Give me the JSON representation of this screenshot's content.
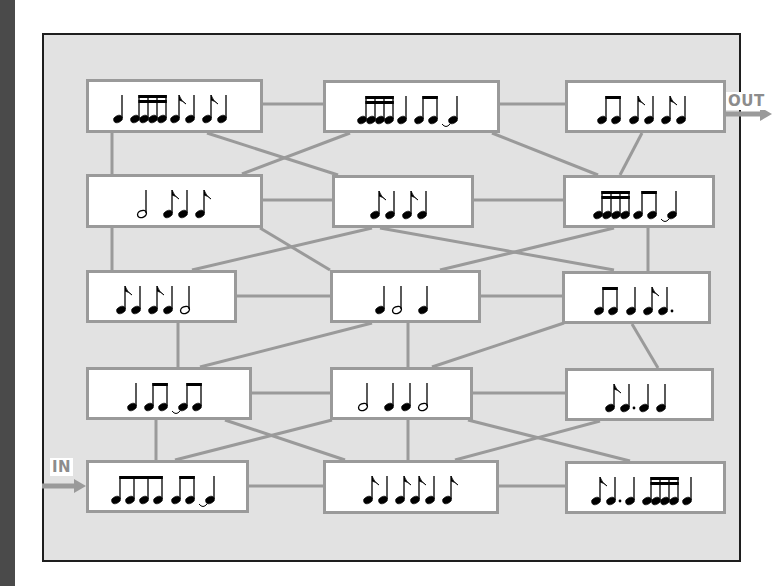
{
  "diagram": {
    "in_label": "IN",
    "out_label": "OUT",
    "colors": {
      "frame_bg": "#e2e2e2",
      "frame_border": "#1e1e1e",
      "line": "#9a9a9a",
      "box_bg": "#ffffff",
      "note": "#000000",
      "io_label": "#8c8c8c"
    },
    "note_legend": {
      "q": "quarter note",
      "h": "half note",
      "e": "single eighth note (flag)",
      "dq": "dotted quarter note",
      "b8": "beamed eighth-note group",
      "b16": "beamed sixteenth-note group",
      "tie": "tie to next note"
    },
    "boxes": [
      {
        "id": "r1c1",
        "row": 1,
        "col": 1,
        "x": 86,
        "y": 79,
        "w": 177,
        "h": 54,
        "rhythm": [
          "q",
          "b16x4",
          "e",
          "q",
          "e",
          "q"
        ]
      },
      {
        "id": "r1c2",
        "row": 1,
        "col": 2,
        "x": 323,
        "y": 80,
        "w": 177,
        "h": 53,
        "rhythm": [
          "b16x4",
          "q",
          "b8x2",
          "tie",
          "q"
        ]
      },
      {
        "id": "r1c3",
        "row": 1,
        "col": 3,
        "x": 565,
        "y": 80,
        "w": 161,
        "h": 53,
        "rhythm": [
          "b8x2",
          "e",
          "q",
          "e",
          "q"
        ]
      },
      {
        "id": "r2c1",
        "row": 2,
        "col": 1,
        "x": 86,
        "y": 174,
        "w": 177,
        "h": 54,
        "rhythm": [
          "h",
          "e",
          "q",
          "e"
        ]
      },
      {
        "id": "r2c2",
        "row": 2,
        "col": 2,
        "x": 332,
        "y": 175,
        "w": 142,
        "h": 53,
        "rhythm": [
          "e",
          "q",
          "e",
          "q"
        ]
      },
      {
        "id": "r2c3",
        "row": 2,
        "col": 3,
        "x": 563,
        "y": 175,
        "w": 152,
        "h": 53,
        "rhythm": [
          "b16x4",
          "b8x2",
          "tie",
          "q"
        ]
      },
      {
        "id": "r3c1",
        "row": 3,
        "col": 1,
        "x": 86,
        "y": 270,
        "w": 151,
        "h": 53,
        "rhythm": [
          "e",
          "q",
          "e",
          "q",
          "h"
        ]
      },
      {
        "id": "r3c2",
        "row": 3,
        "col": 2,
        "x": 330,
        "y": 270,
        "w": 151,
        "h": 53,
        "rhythm": [
          "q",
          "h",
          "q"
        ]
      },
      {
        "id": "r3c3",
        "row": 3,
        "col": 3,
        "x": 562,
        "y": 271,
        "w": 149,
        "h": 53,
        "rhythm": [
          "b8x2",
          "q",
          "e",
          "dq"
        ]
      },
      {
        "id": "r4c1",
        "row": 4,
        "col": 1,
        "x": 86,
        "y": 367,
        "w": 166,
        "h": 53,
        "rhythm": [
          "q",
          "b8x2",
          "tie",
          "b8x2"
        ]
      },
      {
        "id": "r4c2",
        "row": 4,
        "col": 2,
        "x": 330,
        "y": 367,
        "w": 143,
        "h": 53,
        "rhythm": [
          "h",
          "q",
          "q",
          "h"
        ]
      },
      {
        "id": "r4c3",
        "row": 4,
        "col": 3,
        "x": 565,
        "y": 368,
        "w": 149,
        "h": 53,
        "rhythm": [
          "e",
          "dq",
          "q",
          "q"
        ]
      },
      {
        "id": "r5c1",
        "row": 5,
        "col": 1,
        "x": 86,
        "y": 460,
        "w": 163,
        "h": 53,
        "rhythm": [
          "b8x4",
          "b8x2",
          "tie",
          "q"
        ]
      },
      {
        "id": "r5c2",
        "row": 5,
        "col": 2,
        "x": 323,
        "y": 460,
        "w": 176,
        "h": 54,
        "rhythm": [
          "e",
          "q",
          "e",
          "e",
          "q",
          "e"
        ]
      },
      {
        "id": "r5c3",
        "row": 5,
        "col": 3,
        "x": 565,
        "y": 461,
        "w": 161,
        "h": 53,
        "rhythm": [
          "e",
          "dq",
          "q",
          "b16x4",
          "q"
        ]
      }
    ],
    "links": [
      {
        "from": "r1c1",
        "to": "r1c2",
        "x1": 263,
        "y1": 104,
        "x2": 323,
        "y2": 104
      },
      {
        "from": "r1c2",
        "to": "r1c3",
        "x1": 500,
        "y1": 104,
        "x2": 565,
        "y2": 104
      },
      {
        "from": "r1c1",
        "to": "r2c1",
        "x1": 112,
        "y1": 133,
        "x2": 112,
        "y2": 174
      },
      {
        "from": "r1c1",
        "to": "r2c2",
        "x1": 207,
        "y1": 133,
        "x2": 338,
        "y2": 175
      },
      {
        "from": "r1c2",
        "to": "r2c1",
        "x1": 350,
        "y1": 133,
        "x2": 242,
        "y2": 174
      },
      {
        "from": "r1c2",
        "to": "r2c3",
        "x1": 492,
        "y1": 133,
        "x2": 598,
        "y2": 175
      },
      {
        "from": "r1c3",
        "to": "r2c3",
        "x1": 642,
        "y1": 133,
        "x2": 620,
        "y2": 175
      },
      {
        "from": "r2c1",
        "to": "r2c2",
        "x1": 263,
        "y1": 200,
        "x2": 332,
        "y2": 200
      },
      {
        "from": "r2c2",
        "to": "r2c3",
        "x1": 474,
        "y1": 200,
        "x2": 563,
        "y2": 200
      },
      {
        "from": "r2c1",
        "to": "r3c1",
        "x1": 112,
        "y1": 228,
        "x2": 112,
        "y2": 270
      },
      {
        "from": "r2c1",
        "to": "r3c2",
        "x1": 260,
        "y1": 228,
        "x2": 330,
        "y2": 270
      },
      {
        "from": "r2c2",
        "to": "r3c1",
        "x1": 372,
        "y1": 228,
        "x2": 192,
        "y2": 270
      },
      {
        "from": "r2c2",
        "to": "r3c3",
        "x1": 380,
        "y1": 228,
        "x2": 614,
        "y2": 270
      },
      {
        "from": "r2c3",
        "to": "r3c2",
        "x1": 614,
        "y1": 228,
        "x2": 440,
        "y2": 270
      },
      {
        "from": "r2c3",
        "to": "r3c3",
        "x1": 648,
        "y1": 228,
        "x2": 648,
        "y2": 271
      },
      {
        "from": "r3c1",
        "to": "r3c2",
        "x1": 237,
        "y1": 296,
        "x2": 330,
        "y2": 296
      },
      {
        "from": "r3c2",
        "to": "r3c3",
        "x1": 481,
        "y1": 296,
        "x2": 562,
        "y2": 296
      },
      {
        "from": "r3c1",
        "to": "r4c1",
        "x1": 178,
        "y1": 323,
        "x2": 178,
        "y2": 367
      },
      {
        "from": "r3c2",
        "to": "r4c1",
        "x1": 372,
        "y1": 323,
        "x2": 200,
        "y2": 367
      },
      {
        "from": "r3c2",
        "to": "r4c2",
        "x1": 408,
        "y1": 323,
        "x2": 408,
        "y2": 367
      },
      {
        "from": "r3c3",
        "to": "r4c2",
        "x1": 564,
        "y1": 323,
        "x2": 432,
        "y2": 367
      },
      {
        "from": "r3c3",
        "to": "r4c3",
        "x1": 632,
        "y1": 324,
        "x2": 658,
        "y2": 368
      },
      {
        "from": "r4c1",
        "to": "r4c2",
        "x1": 252,
        "y1": 393,
        "x2": 330,
        "y2": 393
      },
      {
        "from": "r4c2",
        "to": "r4c3",
        "x1": 473,
        "y1": 393,
        "x2": 565,
        "y2": 393
      },
      {
        "from": "r4c1",
        "to": "r5c1",
        "x1": 156,
        "y1": 420,
        "x2": 156,
        "y2": 460
      },
      {
        "from": "r4c1",
        "to": "r5c2",
        "x1": 225,
        "y1": 420,
        "x2": 345,
        "y2": 460
      },
      {
        "from": "r4c2",
        "to": "r5c1",
        "x1": 332,
        "y1": 420,
        "x2": 175,
        "y2": 460
      },
      {
        "from": "r4c2",
        "to": "r5c2",
        "x1": 408,
        "y1": 420,
        "x2": 408,
        "y2": 460
      },
      {
        "from": "r4c2",
        "to": "r5c3",
        "x1": 468,
        "y1": 420,
        "x2": 630,
        "y2": 461
      },
      {
        "from": "r4c3",
        "to": "r5c2",
        "x1": 600,
        "y1": 421,
        "x2": 455,
        "y2": 460
      },
      {
        "from": "r5c1",
        "to": "r5c2",
        "x1": 249,
        "y1": 486,
        "x2": 323,
        "y2": 486
      },
      {
        "from": "r5c2",
        "to": "r5c3",
        "x1": 499,
        "y1": 486,
        "x2": 565,
        "y2": 486
      }
    ],
    "in_arrow": {
      "label_x": 50,
      "label_y": 458,
      "x1": 42,
      "y1": 486,
      "x2": 86
    },
    "out_arrow": {
      "label_x": 726,
      "label_y": 92,
      "x1": 726,
      "y1": 114,
      "x2": 772
    }
  }
}
